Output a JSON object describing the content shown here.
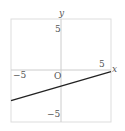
{
  "chart_data": {
    "type": "line",
    "title": "",
    "xlabel": "x",
    "ylabel": "y",
    "xlim": [
      -5.7,
      5.7
    ],
    "ylim": [
      -5.9,
      5.9
    ],
    "grid": false,
    "origin_label": "O",
    "x_ticks": [
      {
        "value": -5,
        "label": "−5"
      },
      {
        "value": 5,
        "label": "5"
      }
    ],
    "y_ticks": [
      {
        "value": 5,
        "label": "5"
      },
      {
        "value": -5,
        "label": "−5"
      }
    ],
    "series": [
      {
        "name": "line",
        "x": [
          -5.7,
          5.7
        ],
        "y": [
          -3.5,
          -0.2
        ],
        "color": "#222222"
      }
    ]
  },
  "labels": {
    "x_axis": "x",
    "y_axis": "y",
    "origin": "O",
    "x_neg5": "−5",
    "x_pos5": "5",
    "y_pos5": "5",
    "y_neg5": "−5"
  },
  "colors": {
    "frame": "#dddddd",
    "axis": "#cccccc",
    "line": "#222222"
  }
}
